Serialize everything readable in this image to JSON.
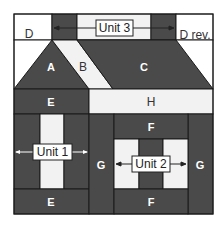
{
  "colors": {
    "dark": "#4a4a4a",
    "light": "#f2f2f2",
    "white": "#ffffff",
    "stroke": "#1a1a1a"
  },
  "pieces": {
    "A": "A",
    "B": "B",
    "C": "C",
    "D": "D",
    "D_rev": "D rev.",
    "E_top": "E",
    "E_bottom": "E",
    "H": "H",
    "F_top": "F",
    "F_bottom": "F",
    "G_left": "G",
    "G_right": "G"
  },
  "units": {
    "unit1": "Unit 1",
    "unit2": "Unit 2",
    "unit3": "Unit 3"
  }
}
